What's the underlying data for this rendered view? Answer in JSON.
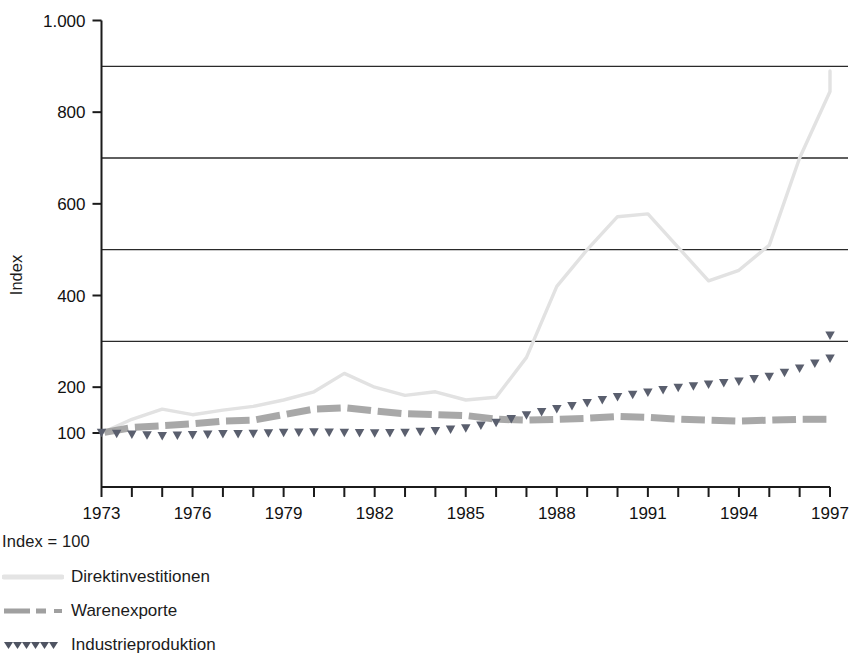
{
  "axis": {
    "ylabel": "Index",
    "yticks": [
      "1.000",
      "800",
      "600",
      "400",
      "200",
      "100"
    ],
    "ytick_values": [
      1000,
      800,
      600,
      400,
      200,
      100
    ],
    "gridlines": [
      900,
      700,
      500,
      300
    ],
    "xticks": [
      "1973",
      "1976",
      "1979",
      "1982",
      "1985",
      "1988",
      "1991",
      "1994",
      "1997"
    ]
  },
  "legend": {
    "note": "Index = 100",
    "items": [
      {
        "label": "Direktinvestitionen",
        "style": "solid-light",
        "color": "#e2e2e2"
      },
      {
        "label": "Warenexporte",
        "style": "dashed-medium",
        "color": "#9a9a9a"
      },
      {
        "label": "Industrieproduktion",
        "style": "dotted-dark",
        "color": "#5a5f6e"
      }
    ]
  },
  "chart_data": {
    "type": "line",
    "title": "",
    "xlabel": "",
    "ylabel": "Index",
    "grid": true,
    "legend_position": "below",
    "xlim": [
      1973,
      1997
    ],
    "ylim": [
      100,
      1000
    ],
    "x": [
      1973,
      1974,
      1975,
      1976,
      1977,
      1978,
      1979,
      1980,
      1981,
      1982,
      1983,
      1984,
      1985,
      1986,
      1987,
      1988,
      1989,
      1990,
      1991,
      1992,
      1993,
      1994,
      1995,
      1996,
      1997
    ],
    "series": [
      {
        "name": "Direktinvestitionen",
        "color": "#e2e2e2",
        "style": "solid-light",
        "values": [
          100,
          130,
          152,
          140,
          150,
          158,
          172,
          190,
          230,
          200,
          182,
          190,
          172,
          178,
          265,
          420,
          500,
          572,
          578,
          505,
          432,
          455,
          510,
          700,
          845
        ]
      },
      {
        "name": "Warenexporte",
        "color": "#9a9a9a",
        "style": "dashed-medium",
        "values": [
          100,
          112,
          116,
          120,
          126,
          128,
          140,
          152,
          155,
          148,
          142,
          140,
          138,
          130,
          128,
          130,
          132,
          136,
          134,
          130,
          128,
          126,
          128,
          130,
          130
        ]
      },
      {
        "name": "Industrieproduktion",
        "color": "#5a5f6e",
        "style": "dotted-dark",
        "values": [
          100,
          96,
          93,
          95,
          97,
          98,
          100,
          101,
          100,
          99,
          100,
          104,
          110,
          122,
          138,
          152,
          165,
          178,
          188,
          198,
          205,
          212,
          222,
          240,
          262
        ]
      }
    ],
    "series_endpoints": {
      "Direktinvestitionen": 890,
      "Warenexporte": 130,
      "Industrieproduktion": 312
    },
    "annotations": [
      "Direktinvestitionen peaks near 230 in 1981, dips to about 172 in 1985",
      "Direktinvestitionen plateaus near 575 in 1989-1990, falls to about 432 in 1992",
      "Direktinvestitionen peaks at about 845 in 1995, dips to about 790, ends near 890 in 1997",
      "Industrieproduktion rises steadily from 100 to about 312",
      "Warenexporte stays near 100-155 across the whole period"
    ]
  }
}
